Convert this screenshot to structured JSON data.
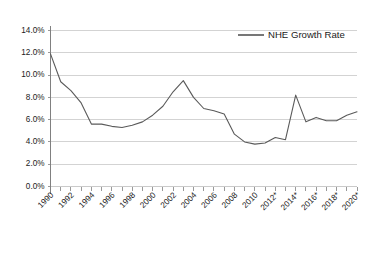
{
  "chart_data": {
    "type": "line",
    "title": "",
    "xlabel": "",
    "ylabel": "",
    "ylim": [
      0,
      14
    ],
    "ytick_values": [
      0,
      2,
      4,
      6,
      8,
      10,
      12,
      14
    ],
    "ytick_labels": [
      "0.0%",
      "2.0%",
      "4.0%",
      "6.0%",
      "8.0%",
      "10.0%",
      "12.0%",
      "14.0%"
    ],
    "grid": true,
    "grid_axis": "y",
    "legend_position": "top-right",
    "legend": [
      "NHE Growth Rate"
    ],
    "x": [
      1990,
      1991,
      1992,
      1993,
      1994,
      1995,
      1996,
      1997,
      1998,
      1999,
      2000,
      2001,
      2002,
      2003,
      2004,
      2005,
      2006,
      2007,
      2008,
      2009,
      2010,
      2011,
      2012,
      2013,
      2014,
      2015,
      2016,
      2017,
      2018,
      2019,
      2020
    ],
    "xtick_labels": [
      "1990",
      "1992",
      "1994",
      "1996",
      "1998",
      "2000",
      "2002",
      "2004",
      "2006",
      "2008",
      "2010",
      "2012*",
      "2014*",
      "2016*",
      "2018*",
      "2020*"
    ],
    "xtick_years": [
      1990,
      1992,
      1994,
      1996,
      1998,
      2000,
      2002,
      2004,
      2006,
      2008,
      2010,
      2012,
      2014,
      2016,
      2018,
      2020
    ],
    "xlim": [
      1990,
      2020
    ],
    "series": [
      {
        "name": "NHE Growth Rate",
        "color": "#5a5a5a",
        "values": [
          11.9,
          9.4,
          8.6,
          7.5,
          5.6,
          5.6,
          5.4,
          5.3,
          5.5,
          5.8,
          6.4,
          7.2,
          8.5,
          9.5,
          8.0,
          7.0,
          6.8,
          6.5,
          4.7,
          4.0,
          3.8,
          3.9,
          4.4,
          4.2,
          8.2,
          5.8,
          6.2,
          5.9,
          5.9,
          6.4,
          6.7
        ],
        "units": "percent"
      }
    ]
  },
  "legend": {
    "entries": [
      {
        "label": "NHE Growth Rate",
        "color": "#3d3d3d"
      }
    ]
  }
}
